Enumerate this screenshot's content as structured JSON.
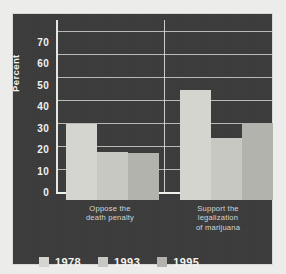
{
  "chart_data": {
    "type": "bar",
    "title": "",
    "subtitle": "",
    "xlabel": "",
    "ylabel": "Percent",
    "ylim": [
      0,
      75
    ],
    "yticks": [
      0,
      10,
      20,
      30,
      40,
      50,
      60,
      70
    ],
    "grid": true,
    "legend_position": "bottom",
    "categories": [
      "Oppose the death penalty",
      "Support the legalization of marijuana"
    ],
    "category_lines": [
      [
        "Oppose the",
        "death penalty"
      ],
      [
        "Support the",
        "legalization",
        "of marijuana"
      ]
    ],
    "series": [
      {
        "name": "1978",
        "values": [
          33,
          48
        ],
        "color": "#d5d5cf"
      },
      {
        "name": "1993",
        "values": [
          21,
          27
        ],
        "color": "#c8c8c2"
      },
      {
        "name": "1995",
        "values": [
          20.5,
          33.5
        ],
        "color": "#b3b3ad"
      }
    ]
  },
  "axis": {
    "y_tick_labels": [
      "70",
      "60",
      "50",
      "40",
      "30",
      "20",
      "10",
      "0"
    ],
    "y_axis_title": "Percent"
  },
  "legend": {
    "items": [
      {
        "label": "1978",
        "color": "#d5d5cf"
      },
      {
        "label": "1993",
        "color": "#c8c8c2"
      },
      {
        "label": "1995",
        "color": "#b3b3ad"
      }
    ]
  },
  "colors": {
    "panel_background": "#3c3c3c",
    "page_background": "#ececeb",
    "gridline": "#cfcfcb",
    "axis": "#f0f0ec",
    "text": "#f2f2ee",
    "category_text": "#d6d6d2"
  }
}
